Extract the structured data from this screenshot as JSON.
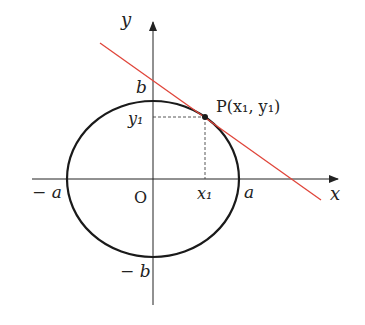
{
  "diagram": {
    "axes": {
      "x_label": "x",
      "y_label": "y",
      "origin_label": "O"
    },
    "ellipse": {
      "labels": {
        "neg_a": "− a",
        "a": "a",
        "b": "b",
        "neg_b": "− b"
      },
      "stroke_color": "#1a1a1a"
    },
    "point": {
      "label_prefix": "P",
      "label": "P(x₁, y₁)",
      "x_label": "x₁",
      "y_label": "y₁"
    },
    "tangent_line": {
      "color": "#e0453a"
    }
  }
}
